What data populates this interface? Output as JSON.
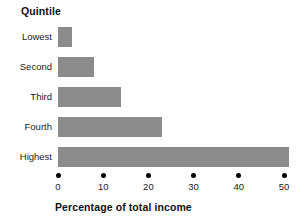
{
  "chart_data": {
    "type": "bar",
    "orientation": "horizontal",
    "title": "",
    "group_title": "Quintile",
    "categories": [
      "Lowest",
      "Second",
      "Third",
      "Fourth",
      "Highest"
    ],
    "values": [
      3,
      8,
      14,
      23,
      51
    ],
    "xlabel": "Percentage of total income",
    "ylabel": "Quintile",
    "xlim": [
      0,
      50
    ],
    "xticks": [
      0,
      10,
      20,
      30,
      40,
      50
    ],
    "xtick_labels": [
      "0",
      "10",
      "20",
      "30",
      "40",
      "50"
    ],
    "grid": false,
    "legend": false,
    "bar_color": "#8b8b8b",
    "tick_marker": "dot",
    "background_color": "#ffffff",
    "text_color": "#1a1a1a"
  }
}
